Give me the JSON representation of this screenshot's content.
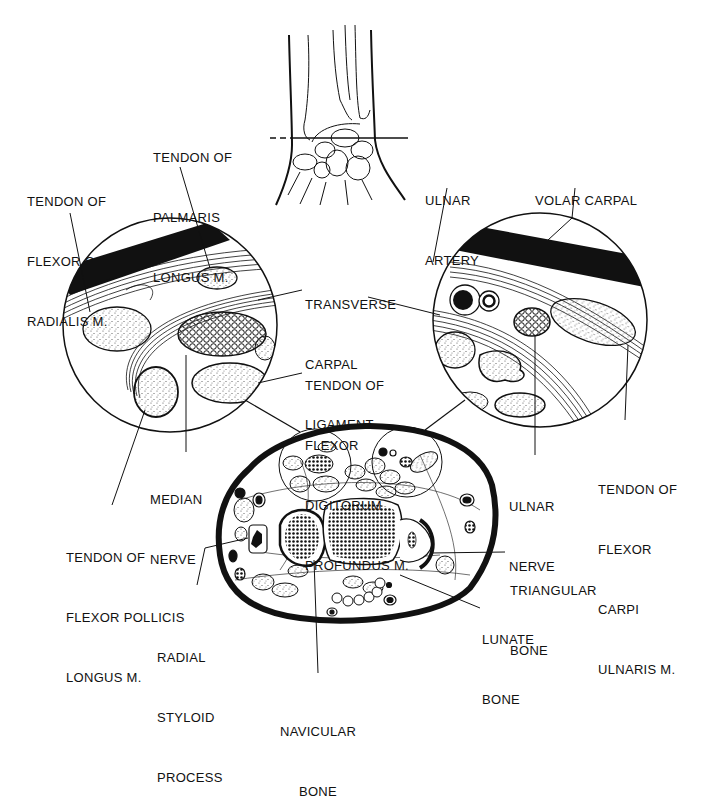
{
  "figure": {
    "colors": {
      "ink": "#111111",
      "background": "#ffffff",
      "stipple": "#555555"
    }
  },
  "labels": {
    "tendon_palmaris_longus": [
      "TENDON OF",
      "PALMARIS",
      "LONGUS M."
    ],
    "tendon_flexor_carpi_radialis": [
      "TENDON OF",
      "FLEXOR CARPI",
      "RADIALIS M."
    ],
    "ulnar_artery": [
      "ULNAR",
      "ARTERY"
    ],
    "volar_carpal_ligament": [
      "VOLAR CARPAL",
      "LIGAMENT"
    ],
    "transverse_carpal_ligament": [
      "TRANSVERSE",
      "CARPAL",
      "LIGAMENT"
    ],
    "tendon_flexor_digitorum_profundus": [
      "TENDON OF",
      "FLEXOR",
      "DIGITORUM",
      "PROFUNDUS M."
    ],
    "median_nerve": [
      "MEDIAN",
      "NERVE"
    ],
    "ulnar_nerve": [
      "ULNAR",
      "NERVE"
    ],
    "tendon_flexor_carpi_ulnaris": [
      "TENDON OF",
      "FLEXOR",
      "CARPI",
      "ULNARIS M."
    ],
    "tendon_flexor_pollicis_longus": [
      "TENDON OF",
      "FLEXOR POLLICIS",
      "LONGUS M."
    ],
    "triangular_bone": [
      "TRIANGULAR",
      "BONE"
    ],
    "lunate_bone": [
      "LUNATE",
      "BONE"
    ],
    "radial_styloid_process": [
      "RADIAL",
      "STYLOID",
      "PROCESS"
    ],
    "navicular_bone": [
      "NAVICULAR",
      "BONE"
    ]
  }
}
